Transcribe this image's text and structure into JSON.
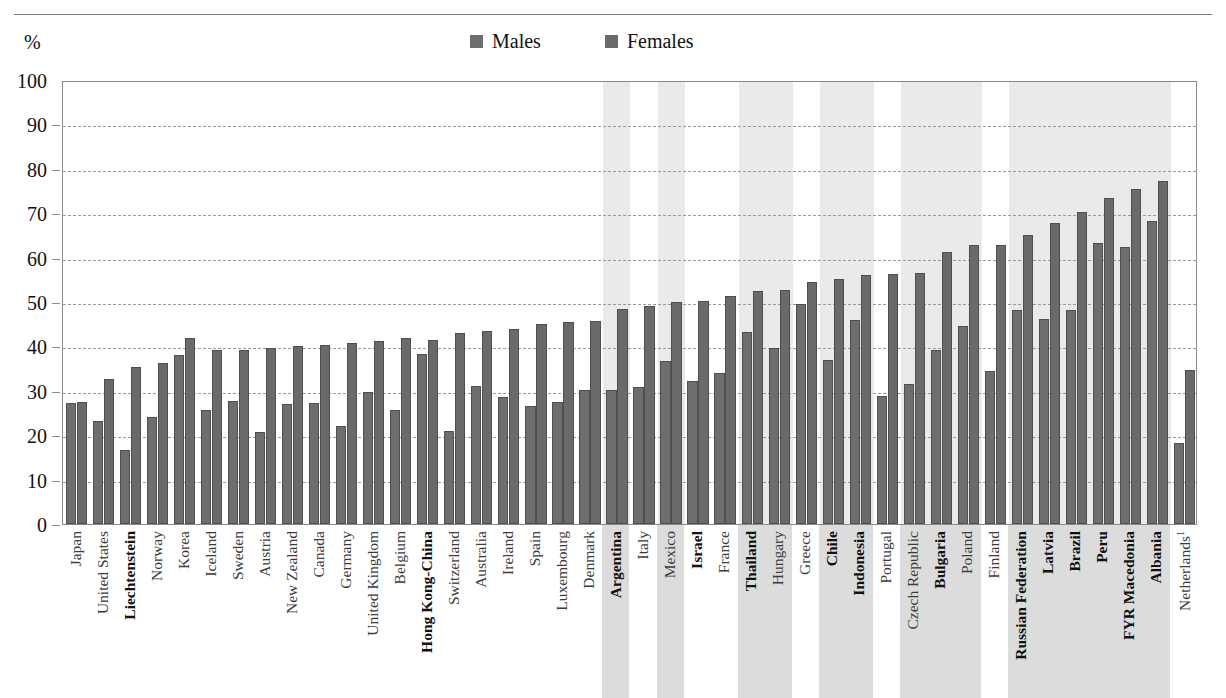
{
  "legend": {
    "items": [
      {
        "label": "Males",
        "color": "#6e6e6e"
      },
      {
        "label": "Females",
        "color": "#6a6a6a"
      }
    ]
  },
  "axis": {
    "unit_label": "%",
    "y_ticks": [
      "100",
      "90",
      "80",
      "70",
      "60",
      "50",
      "40",
      "30",
      "20",
      "10",
      "0"
    ]
  },
  "chart_data": {
    "type": "bar",
    "title": "",
    "xlabel": "",
    "ylabel": "%",
    "ylim": [
      0,
      100
    ],
    "ytick_step": 10,
    "grid": true,
    "legend_position": "top-center",
    "categories": [
      "Japan",
      "United States",
      "Liechtenstein",
      "Norway",
      "Korea",
      "Iceland",
      "Sweden",
      "Austria",
      "New Zealand",
      "Canada",
      "Germany",
      "United Kingdom",
      "Belgium",
      "Hong Kong-China",
      "Switzerland",
      "Australia",
      "Ireland",
      "Spain",
      "Luxembourg",
      "Denmark",
      "Argentina",
      "Italy",
      "Mexico",
      "Israel",
      "France",
      "Thailand",
      "Hungary",
      "Greece",
      "Chile",
      "Indonesia",
      "Portugal",
      "Czech Republic",
      "Bulgaria",
      "Poland",
      "Finland",
      "Russian Federation",
      "Latvia",
      "Brazil",
      "Peru",
      "FYR Macedonia",
      "Albania",
      "Netherlands"
    ],
    "category_styles": [
      {
        "name": "Japan",
        "bold": false,
        "shaded": false,
        "footnote": ""
      },
      {
        "name": "United States",
        "bold": false,
        "shaded": false,
        "footnote": ""
      },
      {
        "name": "Liechtenstein",
        "bold": true,
        "shaded": false,
        "footnote": ""
      },
      {
        "name": "Norway",
        "bold": false,
        "shaded": false,
        "footnote": ""
      },
      {
        "name": "Korea",
        "bold": false,
        "shaded": false,
        "footnote": ""
      },
      {
        "name": "Iceland",
        "bold": false,
        "shaded": false,
        "footnote": ""
      },
      {
        "name": "Sweden",
        "bold": false,
        "shaded": false,
        "footnote": ""
      },
      {
        "name": "Austria",
        "bold": false,
        "shaded": false,
        "footnote": ""
      },
      {
        "name": "New Zealand",
        "bold": false,
        "shaded": false,
        "footnote": ""
      },
      {
        "name": "Canada",
        "bold": false,
        "shaded": false,
        "footnote": ""
      },
      {
        "name": "Germany",
        "bold": false,
        "shaded": false,
        "footnote": ""
      },
      {
        "name": "United Kingdom",
        "bold": false,
        "shaded": false,
        "footnote": ""
      },
      {
        "name": "Belgium",
        "bold": false,
        "shaded": false,
        "footnote": ""
      },
      {
        "name": "Hong Kong-China",
        "bold": true,
        "shaded": false,
        "footnote": ""
      },
      {
        "name": "Switzerland",
        "bold": false,
        "shaded": false,
        "footnote": ""
      },
      {
        "name": "Australia",
        "bold": false,
        "shaded": false,
        "footnote": ""
      },
      {
        "name": "Ireland",
        "bold": false,
        "shaded": false,
        "footnote": ""
      },
      {
        "name": "Spain",
        "bold": false,
        "shaded": false,
        "footnote": ""
      },
      {
        "name": "Luxembourg",
        "bold": false,
        "shaded": false,
        "footnote": ""
      },
      {
        "name": "Denmark",
        "bold": false,
        "shaded": false,
        "footnote": ""
      },
      {
        "name": "Argentina",
        "bold": true,
        "shaded": true,
        "footnote": ""
      },
      {
        "name": "Italy",
        "bold": false,
        "shaded": false,
        "footnote": ""
      },
      {
        "name": "Mexico",
        "bold": false,
        "shaded": true,
        "footnote": ""
      },
      {
        "name": "Israel",
        "bold": true,
        "shaded": false,
        "footnote": ""
      },
      {
        "name": "France",
        "bold": false,
        "shaded": false,
        "footnote": ""
      },
      {
        "name": "Thailand",
        "bold": true,
        "shaded": true,
        "footnote": ""
      },
      {
        "name": "Hungary",
        "bold": false,
        "shaded": true,
        "footnote": ""
      },
      {
        "name": "Greece",
        "bold": false,
        "shaded": false,
        "footnote": ""
      },
      {
        "name": "Chile",
        "bold": true,
        "shaded": true,
        "footnote": ""
      },
      {
        "name": "Indonesia",
        "bold": true,
        "shaded": true,
        "footnote": ""
      },
      {
        "name": "Portugal",
        "bold": false,
        "shaded": false,
        "footnote": ""
      },
      {
        "name": "Czech Republic",
        "bold": false,
        "shaded": true,
        "footnote": ""
      },
      {
        "name": "Bulgaria",
        "bold": true,
        "shaded": true,
        "footnote": ""
      },
      {
        "name": "Poland",
        "bold": false,
        "shaded": true,
        "footnote": ""
      },
      {
        "name": "Finland",
        "bold": false,
        "shaded": false,
        "footnote": ""
      },
      {
        "name": "Russian Federation",
        "bold": true,
        "shaded": true,
        "footnote": ""
      },
      {
        "name": "Latvia",
        "bold": true,
        "shaded": true,
        "footnote": ""
      },
      {
        "name": "Brazil",
        "bold": true,
        "shaded": true,
        "footnote": ""
      },
      {
        "name": "Peru",
        "bold": true,
        "shaded": true,
        "footnote": ""
      },
      {
        "name": "FYR Macedonia",
        "bold": true,
        "shaded": true,
        "footnote": ""
      },
      {
        "name": "Albania",
        "bold": true,
        "shaded": true,
        "footnote": ""
      },
      {
        "name": "Netherlands",
        "bold": false,
        "shaded": false,
        "footnote": "1"
      }
    ],
    "series": [
      {
        "name": "Males",
        "color": "#6e6e6e",
        "values": [
          27.3,
          23.2,
          16.6,
          24.1,
          38.0,
          25.7,
          27.7,
          20.8,
          27.1,
          27.2,
          22.1,
          29.8,
          25.7,
          38.2,
          21.0,
          31.1,
          28.6,
          26.6,
          27.4,
          30.1,
          30.1,
          30.8,
          36.8,
          32.2,
          34.1,
          43.3,
          39.7,
          49.6,
          37.0,
          46.0,
          28.8,
          31.5,
          39.3,
          44.7,
          34.5,
          48.1,
          46.2,
          48.2,
          63.3,
          62.3,
          68.2,
          18.2
        ]
      },
      {
        "name": "Females",
        "color": "#6a6a6a",
        "values": [
          27.5,
          32.7,
          35.3,
          36.3,
          41.9,
          39.2,
          39.3,
          39.6,
          40.2,
          40.4,
          40.8,
          41.3,
          41.8,
          41.5,
          43.1,
          43.4,
          43.9,
          45.1,
          45.6,
          45.7,
          48.4,
          49.0,
          50.0,
          50.3,
          51.3,
          52.4,
          52.7,
          54.5,
          55.1,
          56.0,
          56.4,
          56.6,
          61.2,
          62.9,
          62.9,
          65.0,
          67.8,
          70.2,
          73.4,
          75.4,
          77.3,
          34.6
        ]
      }
    ]
  }
}
